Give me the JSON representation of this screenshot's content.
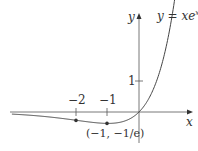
{
  "chart_data": {
    "type": "line",
    "function": "y = x*e^x",
    "xlabel": "x",
    "ylabel": "y",
    "x_ticks": [
      {
        "value": -2,
        "label": "−2"
      },
      {
        "value": -1,
        "label": "−1"
      }
    ],
    "y_ticks": [
      {
        "value": 1,
        "label": "1"
      }
    ],
    "marked_points": [
      {
        "x": -2,
        "y": -0.2707,
        "label": ""
      },
      {
        "x": -1,
        "y": -0.3679,
        "label": "(−1, −1/e)"
      }
    ],
    "xlim": [
      -4.1,
      1.45
    ],
    "ylim": [
      -0.75,
      3.6
    ]
  },
  "labels": {
    "y_axis": "y",
    "x_axis": "x",
    "curve_label_main": "y = xe",
    "curve_label_sup": "x",
    "tick_neg2": "−2",
    "tick_neg1": "−1",
    "tick_y1": "1",
    "min_point": "(−1, −1/e)"
  }
}
